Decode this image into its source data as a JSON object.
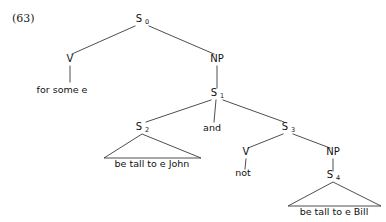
{
  "figure": {
    "example_number": "(63)",
    "kind": "syntax-tree"
  },
  "nodes": {
    "s0": {
      "label": "S",
      "subscript": "0",
      "x": 142,
      "y": 22
    },
    "v_top": {
      "label": "V",
      "subscript": "",
      "x": 70,
      "y": 62
    },
    "np_top": {
      "label": "NP",
      "subscript": "",
      "x": 217,
      "y": 62
    },
    "s1": {
      "label": "S",
      "subscript": "1",
      "x": 217,
      "y": 96
    },
    "s2": {
      "label": "S",
      "subscript": "2",
      "x": 142,
      "y": 130
    },
    "and": {
      "label": "and",
      "subscript": "",
      "x": 212,
      "y": 130
    },
    "s3": {
      "label": "S",
      "subscript": "3",
      "x": 288,
      "y": 130
    },
    "v_right": {
      "label": "V",
      "subscript": "",
      "x": 246,
      "y": 155
    },
    "np_right": {
      "label": "NP",
      "subscript": "",
      "x": 333,
      "y": 155
    },
    "s4": {
      "label": "S",
      "subscript": "4",
      "x": 333,
      "y": 178
    }
  },
  "terminals": {
    "for_some_e": {
      "text": "for some e",
      "x": 62,
      "y": 93
    },
    "not": {
      "text": "not",
      "x": 243,
      "y": 176
    },
    "be_tall_john": {
      "text": "be tall to e John",
      "x": 152,
      "y": 167
    },
    "be_tall_bill": {
      "text": "be tall to e Bill",
      "x": 334,
      "y": 215
    }
  },
  "triangles": {
    "s2_triangle": {
      "apex_x": 142,
      "apex_y": 134,
      "left_x": 104,
      "right_x": 201,
      "base_y": 158
    },
    "s4_triangle": {
      "apex_x": 333,
      "apex_y": 182,
      "left_x": 288,
      "right_x": 381,
      "base_y": 206
    }
  },
  "edges": [
    {
      "name": "s0-to-v",
      "x1": 135,
      "y1": 26,
      "x2": 72,
      "y2": 54
    },
    {
      "name": "s0-to-np",
      "x1": 149,
      "y1": 26,
      "x2": 214,
      "y2": 54
    },
    {
      "name": "v-to-for-some-e",
      "x1": 70,
      "y1": 66,
      "x2": 70,
      "y2": 82
    },
    {
      "name": "np-to-s1",
      "x1": 217,
      "y1": 66,
      "x2": 217,
      "y2": 88
    },
    {
      "name": "s1-to-s2",
      "x1": 211,
      "y1": 100,
      "x2": 146,
      "y2": 122
    },
    {
      "name": "s1-to-and",
      "x1": 216,
      "y1": 100,
      "x2": 214,
      "y2": 122
    },
    {
      "name": "s1-to-s3",
      "x1": 223,
      "y1": 100,
      "x2": 284,
      "y2": 122
    },
    {
      "name": "s3-to-v",
      "x1": 283,
      "y1": 134,
      "x2": 248,
      "y2": 148
    },
    {
      "name": "s3-to-np",
      "x1": 293,
      "y1": 134,
      "x2": 330,
      "y2": 148
    },
    {
      "name": "v-to-not",
      "x1": 246,
      "y1": 159,
      "x2": 245,
      "y2": 169
    },
    {
      "name": "np-to-s4",
      "x1": 333,
      "y1": 159,
      "x2": 333,
      "y2": 171
    }
  ],
  "colors": {
    "background": "#ffffff",
    "line": "#3a3a3a",
    "text": "#111111"
  }
}
